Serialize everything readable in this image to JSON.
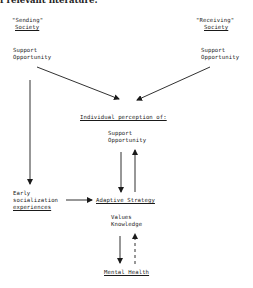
{
  "heading": "f relevant literature:",
  "nodes": {
    "sending_society": {
      "line1": "\"Sending\"",
      "line2": "Society"
    },
    "sending_support": {
      "line1": "Support",
      "line2": "Opportunity"
    },
    "receiving_society": {
      "line1": "\"Receiving\"",
      "line2": "Society"
    },
    "receiving_support": {
      "line1": "Support",
      "line2": "Opportunity"
    },
    "perception": {
      "title": "Individual perception of:",
      "line1": "Support",
      "line2": "Opportunity"
    },
    "early_socialization": {
      "line1": "Early",
      "line2": "socialization",
      "line3": "experiences"
    },
    "adaptive_strategy": {
      "title": "Adaptive Strategy",
      "line1": "Values",
      "line2": "Knowledge"
    },
    "mental_health": {
      "title": "Mental Health"
    }
  },
  "edges": [
    {
      "from": "sending_support",
      "to": "perception",
      "style": "solid"
    },
    {
      "from": "receiving_support",
      "to": "perception",
      "style": "solid"
    },
    {
      "from": "sending_support",
      "to": "early_socialization",
      "style": "solid"
    },
    {
      "from": "perception",
      "to": "adaptive_strategy",
      "style": "solid"
    },
    {
      "from": "adaptive_strategy",
      "to": "perception",
      "style": "solid"
    },
    {
      "from": "early_socialization",
      "to": "adaptive_strategy",
      "style": "solid"
    },
    {
      "from": "adaptive_strategy",
      "to": "mental_health",
      "style": "solid"
    },
    {
      "from": "mental_health",
      "to": "adaptive_strategy",
      "style": "dashed"
    }
  ],
  "colors": {
    "ink": "#1a1a1a",
    "background": "#ffffff"
  }
}
